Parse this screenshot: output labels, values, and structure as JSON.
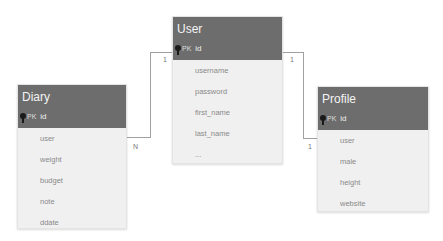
{
  "entities": {
    "user": {
      "title": "User",
      "pk_label": "PK",
      "pk_field": "id",
      "fields": [
        "username",
        "password",
        "first_name",
        "last_name",
        "..."
      ]
    },
    "diary": {
      "title": "Diary",
      "pk_label": "PK",
      "pk_field": "id",
      "fields": [
        "user",
        "weight",
        "budget",
        "note",
        "ddate"
      ]
    },
    "profile": {
      "title": "Profile",
      "pk_label": "PK",
      "pk_field": "id",
      "fields": [
        "user",
        "male",
        "height",
        "website"
      ]
    }
  },
  "relationships": [
    {
      "from": "User",
      "to": "Diary",
      "from_cardinality": "1",
      "to_cardinality": "N"
    },
    {
      "from": "User",
      "to": "Profile",
      "from_cardinality": "1",
      "to_cardinality": "1"
    }
  ],
  "colors": {
    "header": "#6d6d6d",
    "body": "#f0f0f0",
    "connector": "#a0a0a0"
  }
}
